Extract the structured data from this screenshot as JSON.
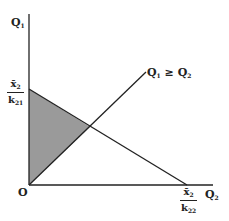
{
  "diagram": {
    "y_axis_label": "Q",
    "y_axis_sub": "1",
    "x_axis_label": "Q",
    "x_axis_sub": "2",
    "origin_label": "O",
    "ray_label": {
      "left": "Q",
      "left_sub": "1",
      "op": " ≥ ",
      "right": "Q",
      "right_sub": "2"
    },
    "y_intercept": {
      "num": "x̄",
      "num_sub": "2",
      "den": "k",
      "den_sub": "21"
    },
    "x_intercept": {
      "num": "x̄",
      "num_sub": "2",
      "den": "k",
      "den_sub": "22"
    },
    "shade_color": "#9a9a9a",
    "line_color": "#222222"
  }
}
